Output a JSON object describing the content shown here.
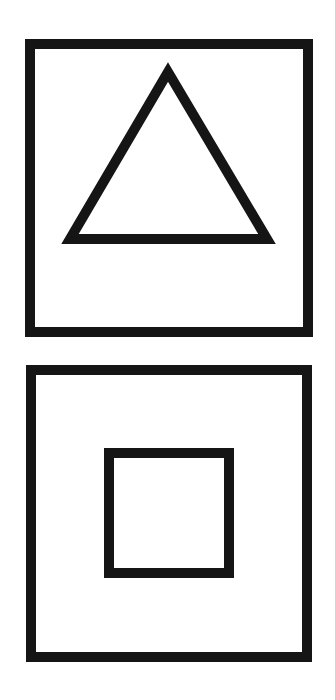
{
  "figure": {
    "panels": [
      {
        "id": "top",
        "frame": "square",
        "inner_shape": "triangle"
      },
      {
        "id": "bottom",
        "frame": "square",
        "inner_shape": "square"
      }
    ],
    "colors": {
      "stroke": "#151515",
      "background": "#ffffff"
    }
  }
}
